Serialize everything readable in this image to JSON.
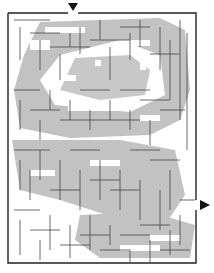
{
  "puzzle": {
    "type": "maze",
    "entry": {
      "side": "top",
      "x": 73
    },
    "exit": {
      "side": "right",
      "y": 205
    },
    "colors": {
      "background": "#ffffff",
      "shade": "#c0c0c0",
      "wall": "#333333",
      "arrow": "#111111"
    },
    "bounds": {
      "left": 8,
      "top": 13,
      "right": 196,
      "bottom": 263
    }
  }
}
